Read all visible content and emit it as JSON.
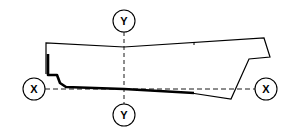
{
  "diagram": {
    "type": "hull-cross-section",
    "labels": {
      "y_top": "Y",
      "y_bottom": "Y",
      "x_left": "X",
      "x_right": "X"
    },
    "colors": {
      "stroke": "#000000",
      "background": "#ffffff"
    }
  }
}
